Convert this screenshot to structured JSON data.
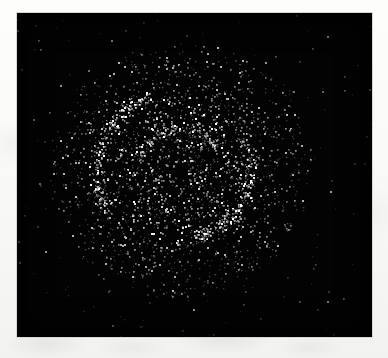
{
  "figure": {
    "kind": "photon-count-image",
    "caption_text": "",
    "title_text": ""
  },
  "colors": {
    "paper_background": "#f7f7f6",
    "detector_background": "#030303",
    "point_source_bright": "#e8e8e8",
    "point_source_mid": "#a8a8a8",
    "point_source_faint": "#5e5e5e",
    "frame_border": "#d8d8d6"
  },
  "frame": {
    "x": 17,
    "y": 13,
    "width": 355,
    "height": 324
  },
  "chart_data": {
    "type": "scatter",
    "title": "",
    "subtitle": "",
    "xlabel": "",
    "ylabel": "",
    "grid": false,
    "legend_position": "none",
    "axis_visible": false,
    "tick_labels_x": [],
    "tick_labels_y": [],
    "xlim": [
      0,
      355
    ],
    "ylim": [
      0,
      324
    ],
    "units": "detector pixels",
    "point_marker": "square",
    "point_size_px": 1.6,
    "background_color": "#030303",
    "series": [
      {
        "name": "object-core-events",
        "color": "#b4b4b4",
        "count": 520,
        "distribution": "annulus",
        "center": [
          163,
          157
        ],
        "radius_inner": 8,
        "radius_outer": 48,
        "note": "Sparse depleted centre with scattered events"
      },
      {
        "name": "inner-ring-events",
        "color": "#cfcfcf",
        "count": 760,
        "distribution": "annulus",
        "center": [
          163,
          157
        ],
        "radius_inner": 46,
        "radius_outer": 78,
        "note": "Brightest ring of the object"
      },
      {
        "name": "outer-halo-events",
        "color": "#9a9a9a",
        "count": 1180,
        "distribution": "annulus",
        "center": [
          163,
          157
        ],
        "radius_inner": 76,
        "radius_outer": 132,
        "note": "Broad outer halo, density falls off with radius"
      },
      {
        "name": "arc-filament-upper-left",
        "color": "#dedede",
        "count": 240,
        "distribution": "arc",
        "center": [
          163,
          157
        ],
        "radius": 84,
        "angle_start_deg": 150,
        "angle_end_deg": 248,
        "thickness": 11,
        "note": "Bright curved filament across upper-left quadrant"
      },
      {
        "name": "arc-filament-lower-right",
        "color": "#d2d2d2",
        "count": 200,
        "distribution": "arc",
        "center": [
          163,
          157
        ],
        "radius": 70,
        "angle_start_deg": 330,
        "angle_end_deg": 80,
        "thickness": 10,
        "note": "Secondary bright filament lower-right"
      },
      {
        "name": "inner-arc-filament",
        "color": "#cccccc",
        "count": 150,
        "distribution": "arc",
        "center": [
          163,
          157
        ],
        "radius": 42,
        "angle_start_deg": 200,
        "angle_end_deg": 330,
        "thickness": 8,
        "note": "Short inner arc just outside the depleted core"
      },
      {
        "name": "background-field-events",
        "color": "#6e6e6e",
        "count": 230,
        "distribution": "uniform",
        "bounds": [
          0,
          0,
          355,
          324
        ],
        "note": "Sparse isolated detections over the whole detector"
      }
    ],
    "notable_points": [
      {
        "label": "isolated-source-right",
        "x": 313,
        "y": 178,
        "brightness": "faint"
      },
      {
        "label": "isolated-source-upper-right",
        "x": 248,
        "y": 49,
        "brightness": "faint"
      },
      {
        "label": "isolated-source-upper-left",
        "x": 43,
        "y": 72,
        "brightness": "faint"
      },
      {
        "label": "isolated-source-lower-left",
        "x": 28,
        "y": 238,
        "brightness": "faint"
      },
      {
        "label": "isolated-source-bottom",
        "x": 176,
        "y": 296,
        "brightness": "faint"
      }
    ]
  }
}
